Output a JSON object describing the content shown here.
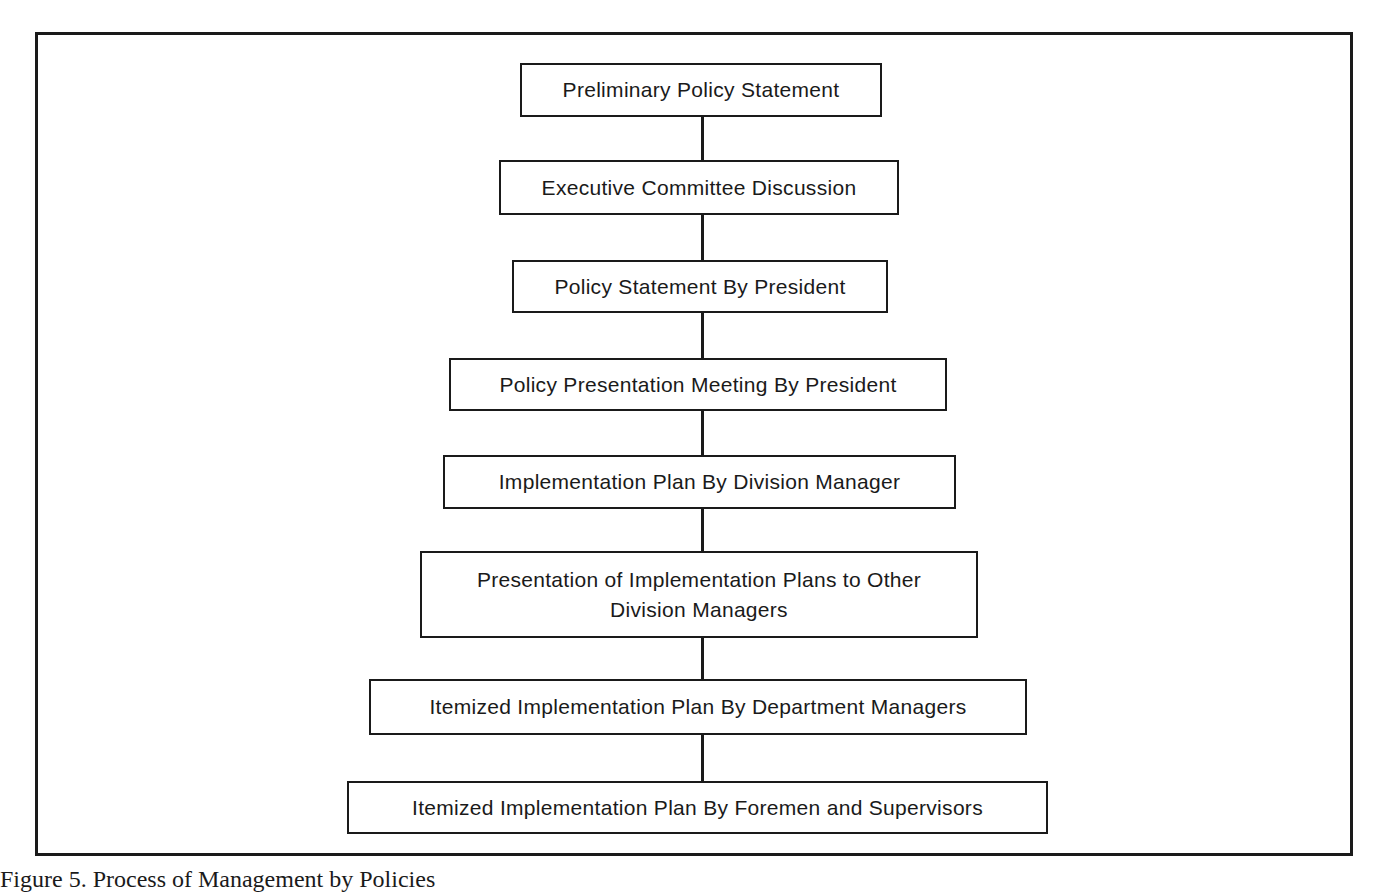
{
  "diagram": {
    "type": "flowchart-vertical",
    "steps": [
      {
        "label": "Preliminary Policy Statement"
      },
      {
        "label": "Executive Committee Discussion"
      },
      {
        "label": "Policy Statement By President"
      },
      {
        "label": "Policy Presentation Meeting By President"
      },
      {
        "label": "Implementation Plan By Division Manager"
      },
      {
        "label": "Presentation of Implementation Plans to Other Division Managers"
      },
      {
        "label": "Itemized Implementation Plan By Department Managers"
      },
      {
        "label": "Itemized Implementation Plan By Foremen and Supervisors"
      }
    ]
  },
  "caption": "Figure 5. Process of Management by Policies"
}
